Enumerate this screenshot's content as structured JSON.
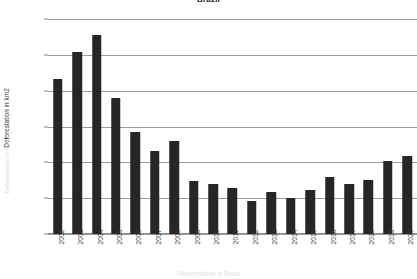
{
  "chart_data": {
    "type": "bar",
    "title": "Brazil",
    "subtitle": "",
    "xlabel": "",
    "ylabel": "Deforestation in km2",
    "categories": [
      "2002",
      "2003",
      "2004",
      "2005",
      "2006",
      "2007",
      "2008",
      "2009",
      "2010",
      "2011",
      "2012",
      "2013",
      "2014",
      "2015",
      "2016",
      "2017",
      "2018",
      "2019",
      "2020"
    ],
    "values": [
      21650,
      25400,
      27770,
      18950,
      14290,
      11650,
      12910,
      7460,
      7000,
      6420,
      4570,
      5840,
      4980,
      6210,
      7890,
      6950,
      7540,
      10130,
      10850
    ],
    "ylim": [
      0,
      30000
    ],
    "ytick_labels": [
      "0",
      "5000",
      "10000",
      "15000",
      "20000",
      "25000",
      "30000"
    ],
    "ytick_values": [
      0,
      5000,
      10000,
      15000,
      20000,
      25000,
      30000
    ],
    "grid": true,
    "legend": false,
    "legend_position": "none",
    "bar_color": "#262626",
    "grid_color": "#9a9a9a",
    "background_color": "#ffffff",
    "xtick_rotation": -90,
    "caption": "Deforestation in Brazil"
  }
}
